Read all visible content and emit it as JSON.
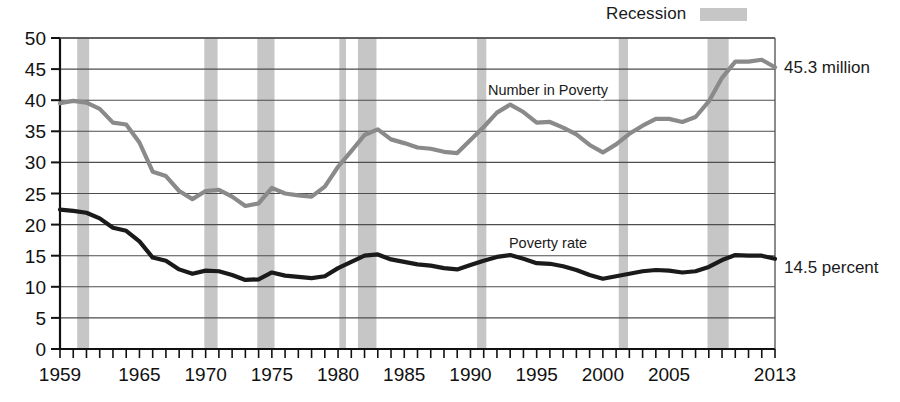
{
  "legend": {
    "recession_label": "Recession",
    "recession_color": "#c6c6c6"
  },
  "annotations": {
    "number_endpoint": "45.3 million",
    "rate_endpoint": "14.5 percent",
    "number_series_label": "Number in Poverty",
    "rate_series_label": "Poverty rate"
  },
  "chart_data": {
    "type": "line",
    "title": "",
    "subtitle": "",
    "xlabel": "",
    "ylabel": "",
    "xlim": [
      1959,
      2013
    ],
    "ylim": [
      0,
      50
    ],
    "grid": true,
    "legend_position": "top-right",
    "y_ticks": [
      0,
      5,
      10,
      15,
      20,
      25,
      30,
      35,
      40,
      45,
      50
    ],
    "x_tick_labels": [
      "1959",
      "1965",
      "1970",
      "1975",
      "1980",
      "1985",
      "1990",
      "1995",
      "2000",
      "2005",
      "2013"
    ],
    "x_tick_label_years": [
      1959,
      1965,
      1970,
      1975,
      1980,
      1985,
      1990,
      1995,
      2000,
      2005,
      2013
    ],
    "x_minor_tick_step": 1,
    "x": [
      1959,
      1960,
      1961,
      1962,
      1963,
      1964,
      1965,
      1966,
      1967,
      1968,
      1969,
      1970,
      1971,
      1972,
      1973,
      1974,
      1975,
      1976,
      1977,
      1978,
      1979,
      1980,
      1981,
      1982,
      1983,
      1984,
      1985,
      1986,
      1987,
      1988,
      1989,
      1990,
      1991,
      1992,
      1993,
      1994,
      1995,
      1996,
      1997,
      1998,
      1999,
      2000,
      2001,
      2002,
      2003,
      2004,
      2005,
      2006,
      2007,
      2008,
      2009,
      2010,
      2011,
      2012,
      2013
    ],
    "series": [
      {
        "name": "Number in Poverty",
        "color": "#8a8a8a",
        "unit": "millions",
        "endpoint_value": 45.3,
        "values": [
          39.5,
          39.9,
          39.6,
          38.6,
          36.4,
          36.1,
          33.2,
          28.5,
          27.8,
          25.4,
          24.1,
          25.4,
          25.6,
          24.5,
          23.0,
          23.4,
          25.9,
          25.0,
          24.7,
          24.5,
          26.1,
          29.3,
          31.8,
          34.4,
          35.3,
          33.7,
          33.1,
          32.4,
          32.2,
          31.7,
          31.5,
          33.6,
          35.7,
          38.0,
          39.3,
          38.1,
          36.4,
          36.5,
          35.6,
          34.5,
          32.8,
          31.6,
          32.9,
          34.6,
          35.9,
          37.0,
          37.0,
          36.5,
          37.3,
          39.8,
          43.6,
          46.2,
          46.2,
          46.5,
          45.3
        ]
      },
      {
        "name": "Poverty rate",
        "color": "#1a1a1a",
        "unit": "percent",
        "endpoint_value": 14.5,
        "values": [
          22.4,
          22.2,
          21.9,
          21.0,
          19.5,
          19.0,
          17.3,
          14.7,
          14.2,
          12.8,
          12.1,
          12.6,
          12.5,
          11.9,
          11.1,
          11.2,
          12.3,
          11.8,
          11.6,
          11.4,
          11.7,
          13.0,
          14.0,
          15.0,
          15.2,
          14.4,
          14.0,
          13.6,
          13.4,
          13.0,
          12.8,
          13.5,
          14.2,
          14.8,
          15.1,
          14.5,
          13.8,
          13.7,
          13.3,
          12.7,
          11.9,
          11.3,
          11.7,
          12.1,
          12.5,
          12.7,
          12.6,
          12.3,
          12.5,
          13.2,
          14.3,
          15.1,
          15.0,
          15.0,
          14.5
        ]
      }
    ],
    "recession_bands": [
      {
        "start": 1960.3,
        "end": 1961.2
      },
      {
        "start": 1969.9,
        "end": 1970.9
      },
      {
        "start": 1973.9,
        "end": 1975.2
      },
      {
        "start": 1980.1,
        "end": 1980.6
      },
      {
        "start": 1981.5,
        "end": 1982.9
      },
      {
        "start": 1990.5,
        "end": 1991.2
      },
      {
        "start": 2001.2,
        "end": 2001.9
      },
      {
        "start": 2007.9,
        "end": 2009.5
      }
    ]
  }
}
